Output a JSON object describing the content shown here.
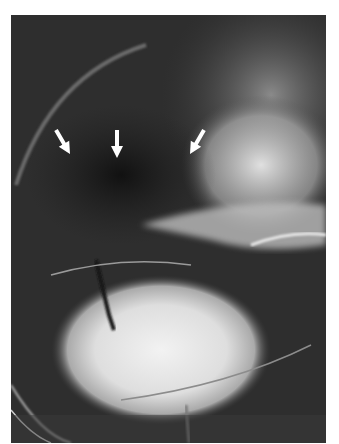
{
  "figure": {
    "type": "radiograph",
    "annotations": [
      {
        "type": "arrow",
        "direction": "down-right",
        "x": 57,
        "y": 128
      },
      {
        "type": "arrow",
        "direction": "down",
        "x": 117,
        "y": 130
      },
      {
        "type": "arrow",
        "direction": "down-left",
        "x": 195,
        "y": 128
      }
    ],
    "arrow_color": "#ffffff",
    "background_color": "#ffffff"
  }
}
